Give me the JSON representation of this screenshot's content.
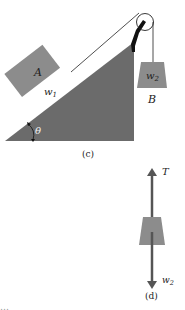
{
  "figure_c": {
    "label": "(c)",
    "block_a": {
      "name": "A",
      "weight": "w",
      "weight_sub": "1"
    },
    "block_b": {
      "name": "B",
      "weight": "w",
      "weight_sub": "2"
    },
    "angle": "θ",
    "colors": {
      "incline": "#6b6b6b",
      "block": "#8c8c8c",
      "bracket": "#111111",
      "string": "#222222"
    }
  },
  "figure_d": {
    "label": "(d)",
    "tension": "T",
    "weight": "w",
    "weight_sub": "2",
    "colors": {
      "arrow": "#555555",
      "block": "#8c8c8c"
    }
  },
  "caption_fragment": "…"
}
